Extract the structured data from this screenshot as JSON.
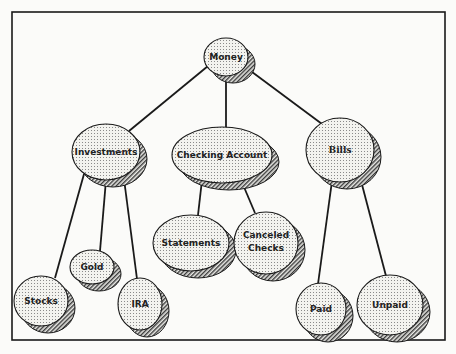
{
  "diagram": {
    "frame": {
      "x": 12,
      "y": 12,
      "w": 433,
      "h": 328
    },
    "colors": {
      "line": "#1a1a1a",
      "fill_dots": "#8c8c8c",
      "fill_bg": "#f2f2ee",
      "shadow": "#555555"
    },
    "nodes": [
      {
        "id": "money",
        "label": "Money",
        "cx": 226,
        "cy": 57,
        "rx": 22,
        "ry": 19
      },
      {
        "id": "investments",
        "label": "Investments",
        "cx": 106,
        "cy": 152,
        "rx": 34,
        "ry": 28
      },
      {
        "id": "checking",
        "label": "Checking Account",
        "cx": 222,
        "cy": 155,
        "rx": 50,
        "ry": 28
      },
      {
        "id": "bills",
        "label": "Bills",
        "cx": 340,
        "cy": 150,
        "rx": 34,
        "ry": 32
      },
      {
        "id": "statements",
        "label": "Statements",
        "cx": 191,
        "cy": 243,
        "rx": 38,
        "ry": 28
      },
      {
        "id": "canceled",
        "label": "Canceled Checks",
        "cx": 266,
        "cy": 243,
        "rx": 32,
        "ry": 31
      },
      {
        "id": "gold",
        "label": "Gold",
        "cx": 92,
        "cy": 267,
        "rx": 22,
        "ry": 17
      },
      {
        "id": "stocks",
        "label": "Stocks",
        "cx": 41,
        "cy": 301,
        "rx": 27,
        "ry": 25
      },
      {
        "id": "ira",
        "label": "IRA",
        "cx": 140,
        "cy": 304,
        "rx": 22,
        "ry": 26
      },
      {
        "id": "paid",
        "label": "Paid",
        "cx": 321,
        "cy": 309,
        "rx": 25,
        "ry": 26
      },
      {
        "id": "unpaid",
        "label": "Unpaid",
        "cx": 390,
        "cy": 305,
        "rx": 33,
        "ry": 30
      }
    ],
    "edges": [
      {
        "from": "money",
        "to": "investments",
        "x1": 208,
        "y1": 66,
        "x2": 129,
        "y2": 131
      },
      {
        "from": "money",
        "to": "checking",
        "x1": 226,
        "y1": 76,
        "x2": 226,
        "y2": 127
      },
      {
        "from": "money",
        "to": "bills",
        "x1": 244,
        "y1": 66,
        "x2": 322,
        "y2": 124
      },
      {
        "from": "investments",
        "to": "stocks",
        "x1": 84,
        "y1": 174,
        "x2": 55,
        "y2": 278
      },
      {
        "from": "investments",
        "to": "gold",
        "x1": 106,
        "y1": 180,
        "x2": 100,
        "y2": 251
      },
      {
        "from": "investments",
        "to": "ira",
        "x1": 124,
        "y1": 179,
        "x2": 137,
        "y2": 279
      },
      {
        "from": "checking",
        "to": "statements",
        "x1": 202,
        "y1": 180,
        "x2": 198,
        "y2": 215
      },
      {
        "from": "checking",
        "to": "canceled",
        "x1": 241,
        "y1": 180,
        "x2": 255,
        "y2": 213
      },
      {
        "from": "bills",
        "to": "paid",
        "x1": 332,
        "y1": 181,
        "x2": 318,
        "y2": 284
      },
      {
        "from": "bills",
        "to": "unpaid",
        "x1": 360,
        "y1": 177,
        "x2": 386,
        "y2": 276
      }
    ]
  }
}
